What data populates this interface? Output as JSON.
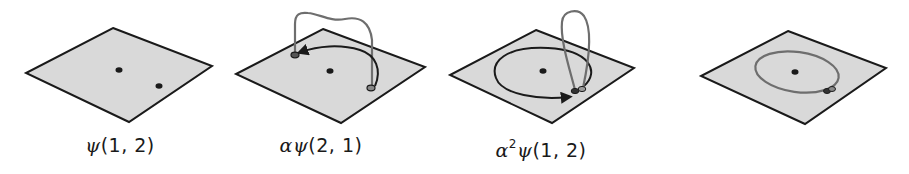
{
  "colors": {
    "plane_fill": "#d9d9d9",
    "plane_edge": "#1a1a1a",
    "particle": "#1a1a1a",
    "exchange_path": "#1a1a1a",
    "braid_loop": "#6e6e6e"
  },
  "panels": [
    {
      "id": "panel-1",
      "label": {
        "prefix": "",
        "power": "",
        "psi": "ψ",
        "args": "(1, 2)"
      },
      "description": "Two particles on a plane, initial configuration"
    },
    {
      "id": "panel-2",
      "label": {
        "prefix": "α",
        "power": "",
        "psi": "ψ",
        "args": "(2, 1)"
      },
      "description": "Particles exchanged by half-winding around center"
    },
    {
      "id": "panel-3",
      "label": {
        "prefix": "α",
        "power": "2",
        "psi": "ψ",
        "args": "(1, 2)"
      },
      "description": "Particle wound fully around the other, returning to start"
    },
    {
      "id": "panel-4",
      "label": {
        "prefix": "",
        "power": "",
        "psi": "",
        "args": ""
      },
      "description": "Resulting closed loop around the center particle"
    }
  ]
}
